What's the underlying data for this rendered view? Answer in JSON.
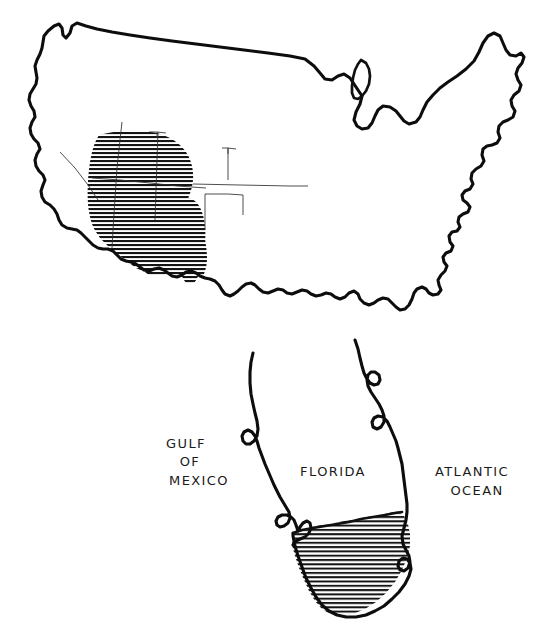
{
  "figure": {
    "background_color": "#ffffff",
    "ink_color": "#0d0d0d",
    "shading_style": "horizontal-line-hatch",
    "width": 550,
    "height": 630
  },
  "maps": {
    "national": {
      "name": "contiguous-united-states",
      "shaded_region_description": "southwestern united states",
      "hatch_spacing_px": 4
    },
    "inset": {
      "name": "florida-detail",
      "shaded_region_description": "southern florida peninsula",
      "hatch_spacing_px": 4
    }
  },
  "labels": [
    {
      "id": "gulf-line-1",
      "text": "GULF",
      "x": 186,
      "y": 448
    },
    {
      "id": "gulf-line-2",
      "text": "OF",
      "x": 190,
      "y": 466
    },
    {
      "id": "gulf-line-3",
      "text": "MEXICO",
      "x": 199,
      "y": 485
    },
    {
      "id": "florida",
      "text": "FLORIDA",
      "x": 333,
      "y": 476
    },
    {
      "id": "atlantic-line-1",
      "text": "ATLANTIC",
      "x": 472,
      "y": 476
    },
    {
      "id": "atlantic-line-2",
      "text": "OCEAN",
      "x": 477,
      "y": 495
    }
  ]
}
